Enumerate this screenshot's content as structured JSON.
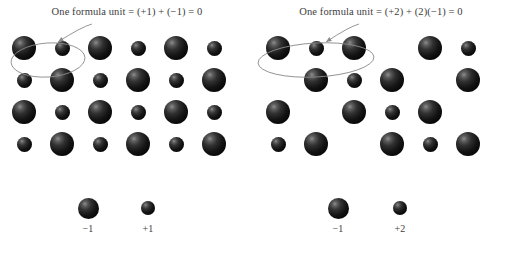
{
  "figure": {
    "background_color": "#ffffff",
    "ion_color": "#141414",
    "annotation_color": "#8a8a8a",
    "text_color": "#3d3d3d"
  },
  "panels": [
    {
      "id": "left",
      "caption": "One formula unit = (+1) + (−1) = 0",
      "lattice": {
        "rows": 4,
        "cols": 6,
        "cells": [
          [
            "anion",
            "cation",
            "anion",
            "cation",
            "anion",
            "cation"
          ],
          [
            "cation",
            "anion",
            "cation",
            "anion",
            "cation",
            "anion"
          ],
          [
            "anion",
            "cation",
            "anion",
            "cation",
            "anion",
            "cation"
          ],
          [
            "cation",
            "anion",
            "cation",
            "anion",
            "cation",
            "anion"
          ]
        ]
      },
      "highlight": {
        "shape": "ellipse",
        "covers_cells": "row 1, columns 1-2",
        "cx": 48,
        "cy": 60,
        "rx": 37,
        "ry": 17,
        "rotation": -4
      },
      "arrow": {
        "from_x": 92,
        "from_y": 24,
        "to_x": 58,
        "to_y": 42
      },
      "legend": [
        {
          "ion": "anion",
          "label": "−1",
          "x": 88
        },
        {
          "ion": "cation",
          "label": "+1",
          "x": 148
        }
      ]
    },
    {
      "id": "right",
      "caption": "One formula unit = (+2) + (2)(−1) = 0",
      "lattice": {
        "rows": 4,
        "cols": 6,
        "cells": [
          [
            "anion",
            "cation",
            "anion",
            "empty",
            "anion",
            "cation"
          ],
          [
            "empty",
            "anion",
            "cation",
            "anion",
            "empty",
            "anion"
          ],
          [
            "anion",
            "empty",
            "anion",
            "cation",
            "anion",
            "empty"
          ],
          [
            "cation",
            "anion",
            "empty",
            "anion",
            "cation",
            "anion"
          ]
        ]
      },
      "highlight": {
        "shape": "ellipse",
        "covers_cells": "row 1, columns 1-3",
        "cx": 62,
        "cy": 60,
        "rx": 58,
        "ry": 17,
        "rotation": -3
      },
      "arrow": {
        "from_x": 105,
        "from_y": 24,
        "to_x": 72,
        "to_y": 42
      },
      "legend": [
        {
          "ion": "anion",
          "label": "−1",
          "x": 84
        },
        {
          "ion": "cation",
          "label": "+2",
          "x": 146
        }
      ]
    }
  ],
  "lattice_geometry": {
    "origin_x": 24,
    "origin_y": 48,
    "col_step": 38,
    "row_step": 32
  }
}
